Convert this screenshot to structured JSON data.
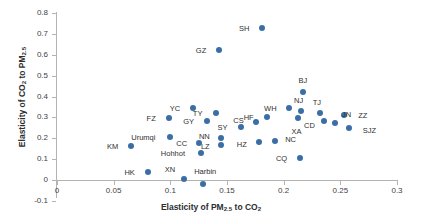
{
  "chart_data": {
    "type": "scatter",
    "title": "",
    "xlabel": "Elasticity of PM2.5 to CO2",
    "ylabel": "Elasticity of CO2 to PM2.5",
    "xlim": [
      0,
      0.3
    ],
    "ylim": [
      -0.1,
      0.8
    ],
    "xticks": [
      "0",
      "0.05",
      "0.1",
      "0.15",
      "0.2",
      "0.25",
      "0.3"
    ],
    "yticks": [
      "0.8",
      "0.7",
      "0.6",
      "0.5",
      "0.4",
      "0.3",
      "0.2",
      "0.1",
      "0",
      "-0.1"
    ],
    "grid": false,
    "legend": "none",
    "marker_color": "#3b6ea5",
    "points": [
      {
        "label": "SH",
        "x": 0.181,
        "y": 0.728,
        "lx": -18,
        "ly": 0
      },
      {
        "label": "GZ",
        "x": 0.143,
        "y": 0.623,
        "lx": -18,
        "ly": 0
      },
      {
        "label": "BJ",
        "x": 0.217,
        "y": 0.42,
        "lx": 0,
        "ly": -12
      },
      {
        "label": "WH",
        "x": 0.205,
        "y": 0.345,
        "lx": -19,
        "ly": 0
      },
      {
        "label": "NJ",
        "x": 0.215,
        "y": 0.33,
        "lx": -2,
        "ly": -11
      },
      {
        "label": "TJ",
        "x": 0.232,
        "y": 0.32,
        "lx": -3,
        "ly": -11
      },
      {
        "label": "YC",
        "x": 0.12,
        "y": 0.345,
        "lx": -18,
        "ly": 0
      },
      {
        "label": "TY",
        "x": 0.14,
        "y": 0.32,
        "lx": -18,
        "ly": 0
      },
      {
        "label": "ZZ",
        "x": 0.253,
        "y": 0.31,
        "lx": 19,
        "ly": 0
      },
      {
        "label": "HF",
        "x": 0.185,
        "y": 0.3,
        "lx": -18,
        "ly": 0
      },
      {
        "label": "XA",
        "x": 0.213,
        "y": 0.295,
        "lx": -2,
        "ly": 13
      },
      {
        "label": "FZ",
        "x": 0.099,
        "y": 0.295,
        "lx": -18,
        "ly": 0
      },
      {
        "label": "GY",
        "x": 0.132,
        "y": 0.285,
        "lx": -18,
        "ly": 0
      },
      {
        "label": "CS",
        "x": 0.176,
        "y": 0.278,
        "lx": -18,
        "ly": -2
      },
      {
        "label": "CD",
        "x": 0.236,
        "y": 0.285,
        "lx": -15,
        "ly": 4
      },
      {
        "label": "JN",
        "x": 0.245,
        "y": 0.272,
        "lx": 12,
        "ly": -9
      },
      {
        "label": "SY",
        "x": 0.162,
        "y": 0.255,
        "lx": -18,
        "ly": 0
      },
      {
        "label": "SJZ",
        "x": 0.258,
        "y": 0.25,
        "lx": 20,
        "ly": 2
      },
      {
        "label": "NN",
        "x": 0.145,
        "y": 0.2,
        "lx": -17,
        "ly": -2
      },
      {
        "label": "LZ",
        "x": 0.145,
        "y": 0.17,
        "lx": -16,
        "ly": 1
      },
      {
        "label": "NC",
        "x": 0.192,
        "y": 0.185,
        "lx": 16,
        "ly": -2
      },
      {
        "label": "HZ",
        "x": 0.178,
        "y": 0.182,
        "lx": -17,
        "ly": 2
      },
      {
        "label": "CC",
        "x": 0.125,
        "y": 0.175,
        "lx": -17,
        "ly": 0
      },
      {
        "label": "Hohhot",
        "x": 0.127,
        "y": 0.128,
        "lx": -28,
        "ly": 0
      },
      {
        "label": "Urumqi",
        "x": 0.1,
        "y": 0.205,
        "lx": -27,
        "ly": 0
      },
      {
        "label": "KM",
        "x": 0.065,
        "y": 0.163,
        "lx": -18,
        "ly": 0
      },
      {
        "label": "CQ",
        "x": 0.214,
        "y": 0.105,
        "lx": -18,
        "ly": 0
      },
      {
        "label": "HK",
        "x": 0.08,
        "y": 0.038,
        "lx": -18,
        "ly": 0
      },
      {
        "label": "XN",
        "x": 0.112,
        "y": 0.003,
        "lx": -14,
        "ly": -10
      },
      {
        "label": "Harbin",
        "x": 0.129,
        "y": -0.018,
        "lx": 2,
        "ly": -13
      }
    ]
  },
  "axis": {
    "x_title_prefix": "Elasticity of PM",
    "x_title_sub1": "2.5",
    "x_title_mid": " to CO",
    "x_title_sub2": "2",
    "y_title_prefix": "Elasticity of CO",
    "y_title_sub1": "2",
    "y_title_mid": " to PM",
    "y_title_sub2": "2.5"
  }
}
